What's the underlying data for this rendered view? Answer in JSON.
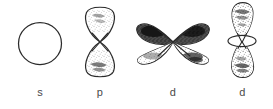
{
  "figure": {
    "style": "hand-drawn pen-and-ink line diagram",
    "background_color": "#ffffff",
    "ink_color": "#2b2b2b",
    "label_color": "#4a4a4a",
    "orbitals": [
      {
        "id": "s-orbital",
        "label": "s",
        "shape": "sphere",
        "shape_description": "single circular outline, unshaded",
        "lobe_count": 1,
        "shading": "none"
      },
      {
        "id": "p-orbital",
        "label": "p",
        "shape": "dumbbell",
        "shape_description": "vertical figure-eight of two teardrop lobes crossing at the waist",
        "lobe_count": 2,
        "shading": "stippled"
      },
      {
        "id": "d-orbital-cloverleaf",
        "label": "d",
        "shape": "cloverleaf",
        "shape_description": "four lobes radiating from a common centre in an X pattern; upper lobes dark, lower lobes lightly stippled",
        "lobe_count": 4,
        "shading": "upper lobes dark, lower lobes light stipple"
      },
      {
        "id": "d-orbital-dz2",
        "label": "d",
        "shape": "dumbbell-with-torus",
        "shape_description": "two vertical teardrop lobes with a horizontal ring (torus) encircling the centre",
        "lobe_count": 2,
        "shading": "stippled",
        "has_torus": true
      }
    ]
  }
}
